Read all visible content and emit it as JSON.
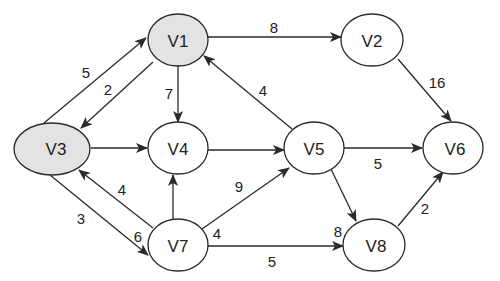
{
  "graph": {
    "type": "directed-weighted-graph",
    "colors": {
      "highlight_fill": "#e3e3e3",
      "normal_fill": "#ffffff",
      "stroke": "#2a2a2a"
    },
    "nodes": [
      {
        "id": "V1",
        "label": "V1",
        "x": 178,
        "y": 40,
        "rx": 30,
        "ry": 26,
        "highlighted": true
      },
      {
        "id": "V2",
        "label": "V2",
        "x": 372,
        "y": 40,
        "rx": 31,
        "ry": 26,
        "highlighted": false
      },
      {
        "id": "V3",
        "label": "V3",
        "x": 52,
        "y": 149,
        "rx": 38,
        "ry": 26,
        "highlighted": true
      },
      {
        "id": "V4",
        "label": "V4",
        "x": 178,
        "y": 148,
        "rx": 30,
        "ry": 26,
        "highlighted": false
      },
      {
        "id": "V5",
        "label": "V5",
        "x": 314,
        "y": 148,
        "rx": 30,
        "ry": 26,
        "highlighted": false
      },
      {
        "id": "V6",
        "label": "V6",
        "x": 453,
        "y": 148,
        "rx": 30,
        "ry": 26,
        "highlighted": false
      },
      {
        "id": "V7",
        "label": "V7",
        "x": 178,
        "y": 245,
        "rx": 30,
        "ry": 26,
        "highlighted": false
      },
      {
        "id": "V8",
        "label": "V8",
        "x": 374,
        "y": 245,
        "rx": 31,
        "ry": 26,
        "highlighted": false
      }
    ],
    "edges": [
      {
        "from": "V3",
        "to": "V1",
        "weight": "5"
      },
      {
        "from": "V1",
        "to": "V3",
        "weight": "2"
      },
      {
        "from": "V1",
        "to": "V2",
        "weight": "8"
      },
      {
        "from": "V1",
        "to": "V4",
        "weight": "7"
      },
      {
        "from": "V2",
        "to": "V6",
        "weight": "16"
      },
      {
        "from": "V5",
        "to": "V1",
        "weight": "4"
      },
      {
        "from": "V3",
        "to": "V4",
        "weight": ""
      },
      {
        "from": "V4",
        "to": "V5",
        "weight": ""
      },
      {
        "from": "V5",
        "to": "V6",
        "weight": "5"
      },
      {
        "from": "V5",
        "to": "V8",
        "weight": "8"
      },
      {
        "from": "V8",
        "to": "V6",
        "weight": "2"
      },
      {
        "from": "V7",
        "to": "V3",
        "weight": "4"
      },
      {
        "from": "V3",
        "to": "V7",
        "weight": "3"
      },
      {
        "from": "V7",
        "to": "V4",
        "weight": ""
      },
      {
        "from": "V7",
        "to": "V5",
        "weight": "9"
      },
      {
        "from": "V7",
        "to": "V8",
        "weight": "5"
      }
    ],
    "labels": {
      "e_v3_v1": "5",
      "e_v1_v3": "2",
      "e_v1_v2": "8",
      "e_v1_v4": "7",
      "e_v2_v6": "16",
      "e_v5_v1": "4",
      "e_v5_v6": "5",
      "e_v5_v8": "8",
      "e_v8_v6": "2",
      "e_v7_v3": "4",
      "e_v3_v7": "3",
      "e_v3_v7_b": "6",
      "e_v7_v5": "9",
      "e_v7_v8_a": "4",
      "e_v7_v8": "5"
    },
    "node_labels": {
      "v1": "V1",
      "v2": "V2",
      "v3": "V3",
      "v4": "V4",
      "v5": "V5",
      "v6": "V6",
      "v7": "V7",
      "v8": "V8"
    }
  }
}
